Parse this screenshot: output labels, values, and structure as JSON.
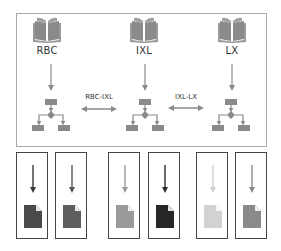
{
  "diagram": {
    "nodes": [
      {
        "id": "rbc",
        "label": "RBC",
        "icon": "book-icon",
        "x": 47
      },
      {
        "id": "ixl",
        "label": "IXL",
        "icon": "book-icon",
        "x": 144
      },
      {
        "id": "lx",
        "label": "LX",
        "icon": "book-icon",
        "x": 232
      }
    ],
    "links": [
      {
        "from": "RBC",
        "to": "IXL",
        "label": "RBC-IXL",
        "bidirectional": true
      },
      {
        "from": "IXL",
        "to": "LX",
        "label": "IXL-LX",
        "bidirectional": true
      }
    ],
    "node_icon_color": "#8a8a8a",
    "flowchart_icon_color": "#8a8a8a",
    "documents": [
      {
        "arrow_color": "#3a3a3a",
        "doc_color": "#4a4a4a"
      },
      {
        "arrow_color": "#555555",
        "doc_color": "#5e5e5e"
      },
      {
        "arrow_color": "#9a9a9a",
        "doc_color": "#9a9a9a"
      },
      {
        "arrow_color": "#2a2a2a",
        "doc_color": "#262626"
      },
      {
        "arrow_color": "#cfcfcf",
        "doc_color": "#d2d2d2"
      },
      {
        "arrow_color": "#8a8a8a",
        "doc_color": "#8a8a8a"
      }
    ]
  }
}
